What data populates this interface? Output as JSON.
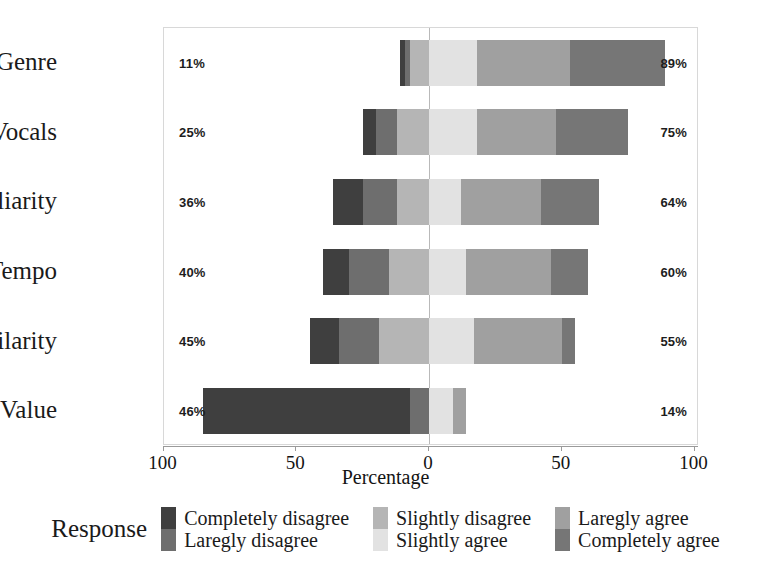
{
  "chart_data": {
    "type": "bar",
    "subtype": "diverging-stacked-likert",
    "title": "",
    "xlabel": "Percentage",
    "ylabel": "",
    "xlim": [
      -100,
      100
    ],
    "xticks": [
      {
        "value": -100,
        "label": "100"
      },
      {
        "value": -50,
        "label": "50"
      },
      {
        "value": 0,
        "label": "0"
      },
      {
        "value": 50,
        "label": "50"
      },
      {
        "value": 100,
        "label": "100"
      }
    ],
    "grid": false,
    "legend_position": "bottom",
    "legend_title": "Response",
    "categories": [
      "Genre",
      "Vocals",
      "Familiarity",
      "Tempo",
      "Similarity",
      "Value"
    ],
    "series": [
      {
        "name": "Completely disagree",
        "color": "#3f3f3f",
        "side": "negative",
        "values": [
          2,
          5,
          11,
          10,
          11,
          78
        ]
      },
      {
        "name": "Laregly disagree",
        "color": "#6e6e6e",
        "side": "negative",
        "values": [
          2,
          8,
          13,
          15,
          15,
          7
        ]
      },
      {
        "name": "Slightly disagree",
        "color": "#b5b5b5",
        "side": "negative",
        "values": [
          7,
          12,
          12,
          15,
          19,
          0
        ]
      },
      {
        "name": "Slightly agree",
        "color": "#e2e2e2",
        "side": "positive",
        "values": [
          18,
          18,
          12,
          14,
          17,
          9
        ]
      },
      {
        "name": "Laregly agree",
        "color": "#a0a0a0",
        "side": "positive",
        "values": [
          35,
          30,
          30,
          32,
          33,
          5
        ]
      },
      {
        "name": "Completely agree",
        "color": "#767676",
        "side": "positive",
        "values": [
          36,
          27,
          22,
          14,
          5,
          0
        ]
      }
    ],
    "row_labels_left": [
      "11%",
      "25%",
      "36%",
      "40%",
      "45%",
      "46%"
    ],
    "row_labels_right": [
      "89%",
      "75%",
      "64%",
      "60%",
      "55%",
      "14%"
    ],
    "negative_totals": [
      11,
      25,
      36,
      40,
      45,
      85
    ],
    "positive_totals": [
      89,
      75,
      64,
      60,
      55,
      14
    ]
  },
  "axis": {
    "x_title": "Percentage"
  },
  "legend": {
    "title": "Response",
    "groups": [
      {
        "items": [
          {
            "label": "Completely disagree",
            "color": "#3f3f3f"
          },
          {
            "label": "Laregly disagree",
            "color": "#6e6e6e"
          }
        ]
      },
      {
        "items": [
          {
            "label": "Slightly disagree",
            "color": "#b5b5b5"
          },
          {
            "label": "Slightly agree",
            "color": "#e2e2e2"
          }
        ]
      },
      {
        "items": [
          {
            "label": "Laregly agree",
            "color": "#a0a0a0"
          },
          {
            "label": "Completely agree",
            "color": "#767676"
          }
        ]
      }
    ]
  },
  "colors": {
    "zero_line": "#b9b9b9",
    "frame": "#d8d8d8",
    "axis": "#9a9a9a",
    "background": "#ffffff",
    "text": "#1a1a1a"
  }
}
